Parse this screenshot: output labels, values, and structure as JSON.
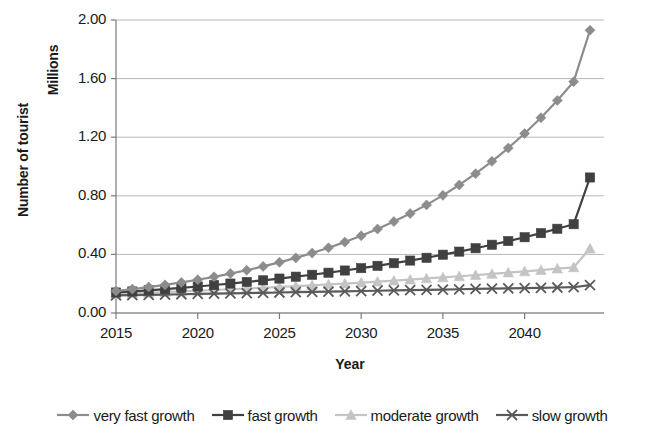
{
  "chart_data": {
    "type": "line",
    "title": "",
    "xlabel": "Year",
    "ylabel": "Number of tourist",
    "units_label": "Millions",
    "xlim": [
      2015,
      2044
    ],
    "ylim": [
      0.0,
      2.0
    ],
    "xticks": [
      2015,
      2020,
      2025,
      2030,
      2035,
      2040
    ],
    "xtick_labels": [
      "2015",
      "2020",
      "2025",
      "2030",
      "2035",
      "2040"
    ],
    "yticks": [
      0.0,
      0.4,
      0.8,
      1.2,
      1.6,
      2.0
    ],
    "ytick_labels": [
      "0.00",
      "0.40",
      "0.80",
      "1.20",
      "1.60",
      "2.00"
    ],
    "grid": "horizontal",
    "legend_position": "bottom",
    "x": [
      2015,
      2016,
      2017,
      2018,
      2019,
      2020,
      2021,
      2022,
      2023,
      2024,
      2025,
      2026,
      2027,
      2028,
      2029,
      2030,
      2031,
      2032,
      2033,
      2034,
      2035,
      2036,
      2037,
      2038,
      2039,
      2040,
      2041,
      2042,
      2043,
      2044
    ],
    "series": [
      {
        "name": "very fast growth",
        "marker": "diamond",
        "color": "#8c8c8c",
        "values": [
          0.15,
          0.163,
          0.177,
          0.192,
          0.209,
          0.227,
          0.247,
          0.269,
          0.292,
          0.318,
          0.346,
          0.376,
          0.409,
          0.445,
          0.484,
          0.527,
          0.573,
          0.624,
          0.679,
          0.738,
          0.803,
          0.874,
          0.951,
          1.035,
          1.126,
          1.225,
          1.333,
          1.451,
          1.579,
          1.93
        ]
      },
      {
        "name": "fast growth",
        "marker": "square",
        "color": "#404040",
        "values": [
          0.14,
          0.147,
          0.155,
          0.163,
          0.172,
          0.181,
          0.191,
          0.201,
          0.212,
          0.223,
          0.235,
          0.248,
          0.261,
          0.275,
          0.29,
          0.306,
          0.322,
          0.34,
          0.358,
          0.377,
          0.398,
          0.419,
          0.442,
          0.466,
          0.491,
          0.517,
          0.545,
          0.575,
          0.606,
          0.925
        ]
      },
      {
        "name": "moderate growth",
        "marker": "triangle",
        "color": "#c4c4c4",
        "values": [
          0.13,
          0.134,
          0.138,
          0.143,
          0.147,
          0.152,
          0.157,
          0.162,
          0.167,
          0.172,
          0.178,
          0.183,
          0.189,
          0.195,
          0.201,
          0.208,
          0.214,
          0.221,
          0.228,
          0.236,
          0.243,
          0.251,
          0.259,
          0.267,
          0.276,
          0.284,
          0.293,
          0.303,
          0.312,
          0.44
        ]
      },
      {
        "name": "slow growth",
        "marker": "x",
        "color": "#5a5a5a",
        "values": [
          0.12,
          0.122,
          0.124,
          0.126,
          0.128,
          0.13,
          0.132,
          0.134,
          0.136,
          0.138,
          0.14,
          0.142,
          0.144,
          0.146,
          0.148,
          0.15,
          0.152,
          0.154,
          0.156,
          0.158,
          0.16,
          0.162,
          0.164,
          0.166,
          0.168,
          0.17,
          0.172,
          0.174,
          0.176,
          0.19
        ]
      }
    ]
  },
  "style": {
    "grid_color": "#b8b8b8",
    "axis_color": "#7a7a7a",
    "text_color": "#1a1a1a",
    "background": "#ffffff"
  }
}
